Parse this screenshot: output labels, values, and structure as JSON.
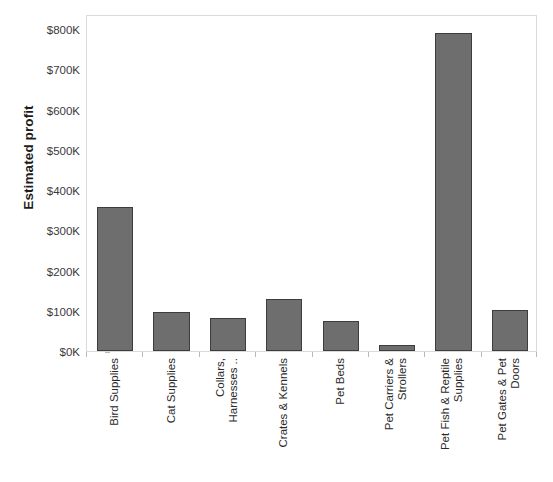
{
  "chart_data": {
    "type": "bar",
    "title": "",
    "subtitle": "",
    "xlabel": "",
    "ylabel": "Estimated profit",
    "ylim": [
      0,
      800000
    ],
    "ytick_values": [
      0,
      100000,
      200000,
      300000,
      400000,
      500000,
      600000,
      700000,
      800000
    ],
    "ytick_labels": [
      "$0K",
      "$100K",
      "$200K",
      "$300K",
      "$400K",
      "$500K",
      "$600K",
      "$700K",
      "$800K"
    ],
    "grid": false,
    "legend": null,
    "categories": [
      "Bird Supplies",
      "Cat Supplies",
      "Collars, Harnesses ..",
      "Crates & Kennels",
      "Pet Beds",
      "Pet Carriers & Strollers",
      "Pet Fish & Reptile Supplies",
      "Pet Gates & Pet Doors"
    ],
    "category_lines": [
      [
        "Bird Supplies"
      ],
      [
        "Cat Supplies"
      ],
      [
        "Collars,",
        "Harnesses .."
      ],
      [
        "Crates & Kennels"
      ],
      [
        "Pet Beds"
      ],
      [
        "Pet Carriers &",
        "Strollers"
      ],
      [
        "Pet Fish & Reptile",
        "Supplies"
      ],
      [
        "Pet Gates & Pet",
        "Doors"
      ]
    ],
    "values": [
      358000,
      97000,
      82000,
      129000,
      75000,
      15000,
      790000,
      102000
    ],
    "value_labels": [
      "$358K",
      "$97K",
      "$82K",
      "$129K",
      "$75K",
      "$15K",
      "$790K",
      "$102K"
    ],
    "bar_color": "#6e6e6e",
    "bar_border_color": "#3d3d3d",
    "plot_border_color": "#dadada",
    "tick_color": "#b9b9b9",
    "text_color": "#2a2a2a"
  }
}
